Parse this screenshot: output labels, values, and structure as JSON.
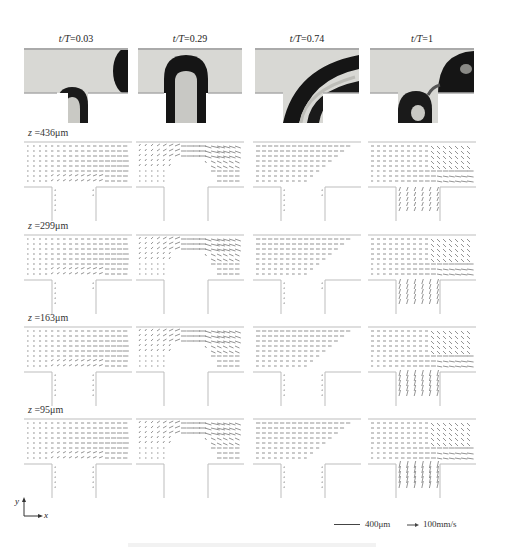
{
  "figure": {
    "columns": [
      {
        "time_label_var": "t/T",
        "time_value": "0.03"
      },
      {
        "time_label_var": "t/T",
        "time_value": "0.29"
      },
      {
        "time_label_var": "t/T",
        "time_value": "0.74"
      },
      {
        "time_label_var": "t/T",
        "time_value": "1"
      }
    ],
    "rows": [
      {
        "z_var": "z",
        "z_value": "436μm"
      },
      {
        "z_var": "z",
        "z_value": "299μm"
      },
      {
        "z_var": "z",
        "z_value": "163μm"
      },
      {
        "z_var": "z",
        "z_value": "95μm"
      }
    ],
    "axes_indicator": {
      "y": "y",
      "x": "x"
    },
    "legend": {
      "length_scale": "400μm",
      "velocity_scale": "100mm/s"
    },
    "colors": {
      "channel_wall": "#b9b9b9",
      "photo_background": "#d9d9d6",
      "droplet": "#1a1a1a",
      "vector": "#555555"
    }
  }
}
